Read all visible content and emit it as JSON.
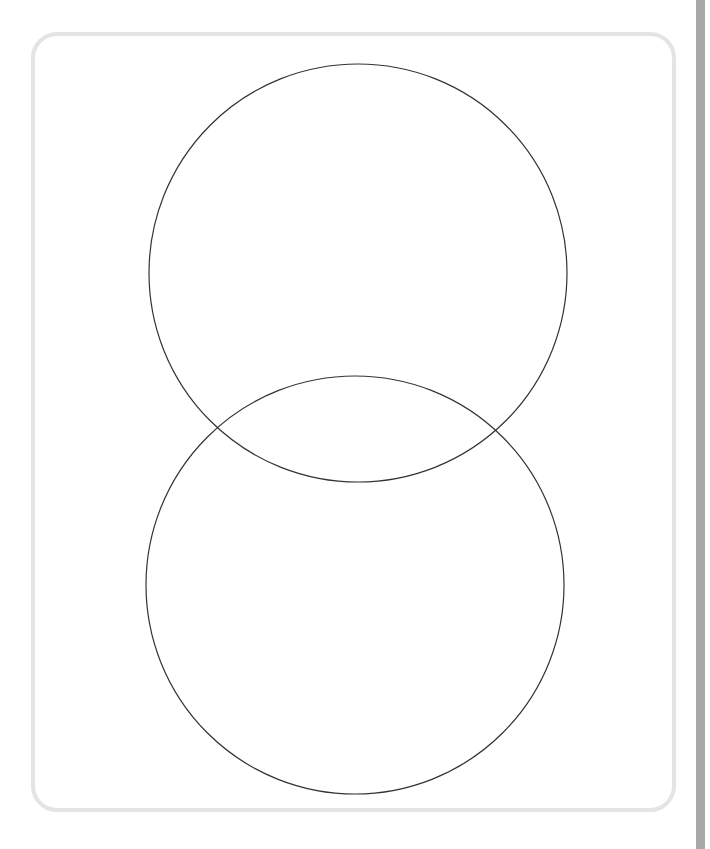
{
  "diagram": {
    "type": "venn",
    "sets": [
      {
        "id": "top",
        "label": "",
        "cx": 358,
        "cy": 273,
        "r": 209
      },
      {
        "id": "bottom",
        "label": "",
        "cx": 355,
        "cy": 585,
        "r": 209
      }
    ],
    "stroke_color": "#333333",
    "frame_color": "#e4e4e4",
    "side_bar_color": "#a8a8a8"
  }
}
